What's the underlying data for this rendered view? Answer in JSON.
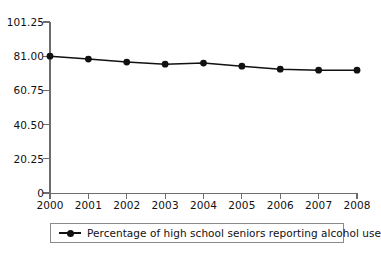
{
  "chart_data": {
    "type": "line",
    "title": "",
    "subtitle": "",
    "xlabel": "",
    "ylabel": "",
    "categories": [
      "2000",
      "2001",
      "2002",
      "2003",
      "2004",
      "2005",
      "2006",
      "2007",
      "2008"
    ],
    "x": [
      2000,
      2001,
      2002,
      2003,
      2004,
      2005,
      2006,
      2007,
      2008
    ],
    "series": [
      {
        "name": "Percentage of high school seniors reporting alcohol use",
        "values": [
          81.0,
          79.3,
          77.5,
          76.3,
          76.9,
          75.1,
          73.3,
          72.7,
          72.7
        ],
        "color": "#111111",
        "marker": "circle"
      }
    ],
    "ylim": [
      0,
      101.25
    ],
    "yticks": [
      0,
      20.25,
      40.5,
      60.75,
      81.0,
      101.25
    ],
    "ytick_labels": [
      "0",
      "20.25",
      "40.50",
      "60.75",
      "81.00",
      "101.25"
    ],
    "xlim": [
      2000,
      2008
    ],
    "xticks": [
      2000,
      2001,
      2002,
      2003,
      2004,
      2005,
      2006,
      2007,
      2008
    ],
    "xtick_labels": [
      "2000",
      "2001",
      "2002",
      "2003",
      "2004",
      "2005",
      "2006",
      "2007",
      "2008"
    ],
    "grid": false,
    "legend_position": "bottom"
  },
  "legend": {
    "entries": [
      {
        "label": "Percentage of high school seniors reporting alcohol use"
      }
    ]
  },
  "colors": {
    "series": "#111111",
    "axis": "#6d6d6d",
    "text": "#111111",
    "background": "#ffffff",
    "legend_border": "#8a8a8a"
  }
}
